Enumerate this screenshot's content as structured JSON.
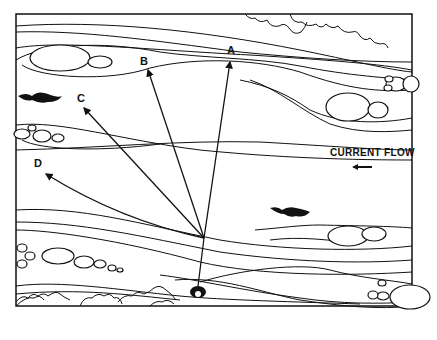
{
  "diagram": {
    "flow_label": "CURRENT FLOW",
    "flow_direction": "left",
    "points": [
      {
        "label": "A",
        "x": 230,
        "y": 55
      },
      {
        "label": "B",
        "x": 145,
        "y": 60
      },
      {
        "label": "C",
        "x": 80,
        "y": 100
      },
      {
        "label": "D",
        "x": 40,
        "y": 163
      }
    ],
    "angler_position": {
      "x": 198,
      "y": 290
    },
    "colors": {
      "ink": "#111111",
      "paper": "#ffffff"
    }
  }
}
